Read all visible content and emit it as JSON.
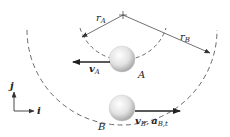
{
  "diagram": {
    "type": "circular-motion-two-particles",
    "center": {
      "x": 123,
      "y": 15
    },
    "labels": {
      "r_a": "r",
      "r_a_sub": "A",
      "r_b": "r",
      "r_b_sub": "B",
      "particle_a": "A",
      "particle_b": "B",
      "v_a": "v",
      "v_a_sub": "A",
      "v_b": "v",
      "v_b_sub": "B",
      "comma": ",",
      "a_b": "a",
      "a_b_sub": "B,t",
      "axis_j": "j",
      "axis_i": "i"
    },
    "colors": {
      "line": "#333333",
      "dash": "#444444",
      "ball_light": "#ffffff",
      "ball_dark": "#b5b5b5"
    }
  }
}
